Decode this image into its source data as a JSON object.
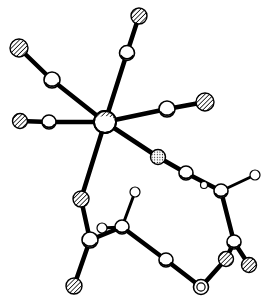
{
  "figure": {
    "title": "Ball-and-stick molecular structure",
    "width": 270,
    "height": 303,
    "background": "#ffffff",
    "bond_color": "#000000",
    "atom_outline": "#000000"
  },
  "atom_styles": {
    "hatched": "hatched-atom (e.g. O)",
    "open": "open-atom (e.g. C)",
    "small_open": "small-open-atom (e.g. H)",
    "metal": "metal-center (partially hatched)",
    "dotted": "dotted-atom",
    "ring": "double-ring-atom"
  },
  "atoms": [
    {
      "id": "M",
      "x": 105,
      "y": 122,
      "r": 11,
      "style": "metal"
    },
    {
      "id": "O1",
      "x": 19,
      "y": 48,
      "r": 9,
      "style": "hatched"
    },
    {
      "id": "C1",
      "x": 52,
      "y": 80,
      "r": 8,
      "style": "open"
    },
    {
      "id": "O2",
      "x": 20,
      "y": 121,
      "r": 7.5,
      "style": "hatched"
    },
    {
      "id": "C2",
      "x": 49,
      "y": 122,
      "r": 7,
      "style": "open"
    },
    {
      "id": "O3",
      "x": 139,
      "y": 16,
      "r": 8,
      "style": "hatched"
    },
    {
      "id": "C3",
      "x": 127,
      "y": 53,
      "r": 7.5,
      "style": "open"
    },
    {
      "id": "O4",
      "x": 205,
      "y": 102,
      "r": 9,
      "style": "hatched"
    },
    {
      "id": "C4",
      "x": 167,
      "y": 109,
      "r": 8,
      "style": "open"
    },
    {
      "id": "X1",
      "x": 158,
      "y": 157,
      "r": 7.5,
      "style": "dotted"
    },
    {
      "id": "C5",
      "x": 186,
      "y": 173,
      "r": 7,
      "style": "open"
    },
    {
      "id": "H1",
      "x": 204,
      "y": 185,
      "r": 3.5,
      "style": "small_open"
    },
    {
      "id": "C6",
      "x": 221,
      "y": 191,
      "r": 7,
      "style": "open"
    },
    {
      "id": "H2",
      "x": 255,
      "y": 175,
      "r": 5,
      "style": "small_open"
    },
    {
      "id": "C7",
      "x": 234,
      "y": 242,
      "r": 7,
      "style": "open"
    },
    {
      "id": "O5",
      "x": 226,
      "y": 259,
      "r": 7.5,
      "style": "hatched"
    },
    {
      "id": "O6",
      "x": 249,
      "y": 265,
      "r": 7.5,
      "style": "hatched"
    },
    {
      "id": "R1",
      "x": 201,
      "y": 287,
      "r": 7.5,
      "style": "ring"
    },
    {
      "id": "C8",
      "x": 166,
      "y": 260,
      "r": 7,
      "style": "open"
    },
    {
      "id": "O7",
      "x": 81,
      "y": 199,
      "r": 8,
      "style": "hatched"
    },
    {
      "id": "C9",
      "x": 90,
      "y": 240,
      "r": 8,
      "style": "open"
    },
    {
      "id": "O8",
      "x": 74,
      "y": 286,
      "r": 8,
      "style": "hatched"
    },
    {
      "id": "H3",
      "x": 102,
      "y": 228,
      "r": 5,
      "style": "small_open"
    },
    {
      "id": "C10",
      "x": 122,
      "y": 227,
      "r": 7,
      "style": "open"
    },
    {
      "id": "H4",
      "x": 135,
      "y": 192,
      "r": 5,
      "style": "small_open"
    }
  ],
  "bonds": [
    [
      "O1",
      "C1"
    ],
    [
      "C1",
      "M"
    ],
    [
      "O2",
      "C2"
    ],
    [
      "C2",
      "M"
    ],
    [
      "O3",
      "C3"
    ],
    [
      "C3",
      "M"
    ],
    [
      "O4",
      "C4"
    ],
    [
      "C4",
      "M"
    ],
    [
      "M",
      "X1"
    ],
    [
      "X1",
      "C5"
    ],
    [
      "C5",
      "C6"
    ],
    [
      "C6",
      "H2"
    ],
    [
      "C6",
      "C7"
    ],
    [
      "C7",
      "O5"
    ],
    [
      "C7",
      "O6"
    ],
    [
      "O5",
      "R1"
    ],
    [
      "R1",
      "C8"
    ],
    [
      "C8",
      "C10"
    ],
    [
      "M",
      "O7"
    ],
    [
      "O7",
      "C9"
    ],
    [
      "C9",
      "O8"
    ],
    [
      "C9",
      "C10"
    ],
    [
      "H3",
      "C10"
    ],
    [
      "C10",
      "H4"
    ]
  ]
}
